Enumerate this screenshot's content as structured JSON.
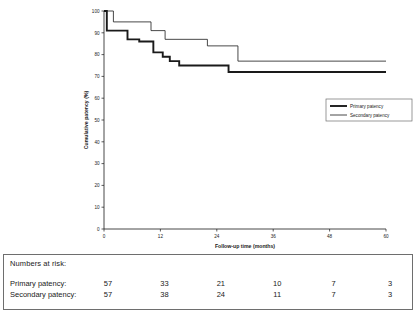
{
  "chart_data": {
    "type": "line",
    "title": "",
    "xlabel": "Follow-up time (months)",
    "ylabel": "Cumulative patency (%)",
    "xlim": [
      0,
      60
    ],
    "ylim": [
      0,
      100
    ],
    "xticks": [
      0,
      12,
      24,
      36,
      48,
      60
    ],
    "yticks": [
      0,
      10,
      20,
      30,
      40,
      50,
      60,
      70,
      80,
      90,
      100
    ],
    "grid": false,
    "legend_position": "center-right",
    "series": [
      {
        "name": "Primary patency",
        "style": "thick",
        "color": "#1a1a1a",
        "steps": [
          [
            0,
            100
          ],
          [
            0.6,
            100
          ],
          [
            0.6,
            91
          ],
          [
            5.0,
            91
          ],
          [
            5.0,
            87
          ],
          [
            7.5,
            87
          ],
          [
            7.5,
            86
          ],
          [
            10.5,
            86
          ],
          [
            10.5,
            81
          ],
          [
            12.5,
            81
          ],
          [
            12.5,
            79
          ],
          [
            14.0,
            79
          ],
          [
            14.0,
            77
          ],
          [
            16.0,
            77
          ],
          [
            16.0,
            75
          ],
          [
            26.5,
            75
          ],
          [
            26.5,
            72
          ],
          [
            60,
            72
          ]
        ]
      },
      {
        "name": "Secondary patency",
        "style": "thin",
        "color": "#1a1a1a",
        "steps": [
          [
            0,
            100
          ],
          [
            2.0,
            100
          ],
          [
            2.0,
            95
          ],
          [
            10.0,
            95
          ],
          [
            10.0,
            91
          ],
          [
            13.0,
            91
          ],
          [
            13.0,
            87
          ],
          [
            22.0,
            87
          ],
          [
            22.0,
            84
          ],
          [
            28.5,
            84
          ],
          [
            28.5,
            77
          ],
          [
            60,
            77
          ]
        ]
      }
    ],
    "legend": [
      {
        "label": "Primary patency",
        "style": "thick"
      },
      {
        "label": "Secondary patency",
        "style": "thin"
      }
    ]
  },
  "risk_table": {
    "title": "Numbers at risk:",
    "timepoints": [
      0,
      12,
      24,
      36,
      48,
      60
    ],
    "rows": [
      {
        "label": "Primary patency:",
        "values": [
          57,
          33,
          21,
          10,
          7,
          3
        ]
      },
      {
        "label": "Secondary patency:",
        "values": [
          57,
          38,
          24,
          11,
          7,
          3
        ]
      }
    ]
  }
}
